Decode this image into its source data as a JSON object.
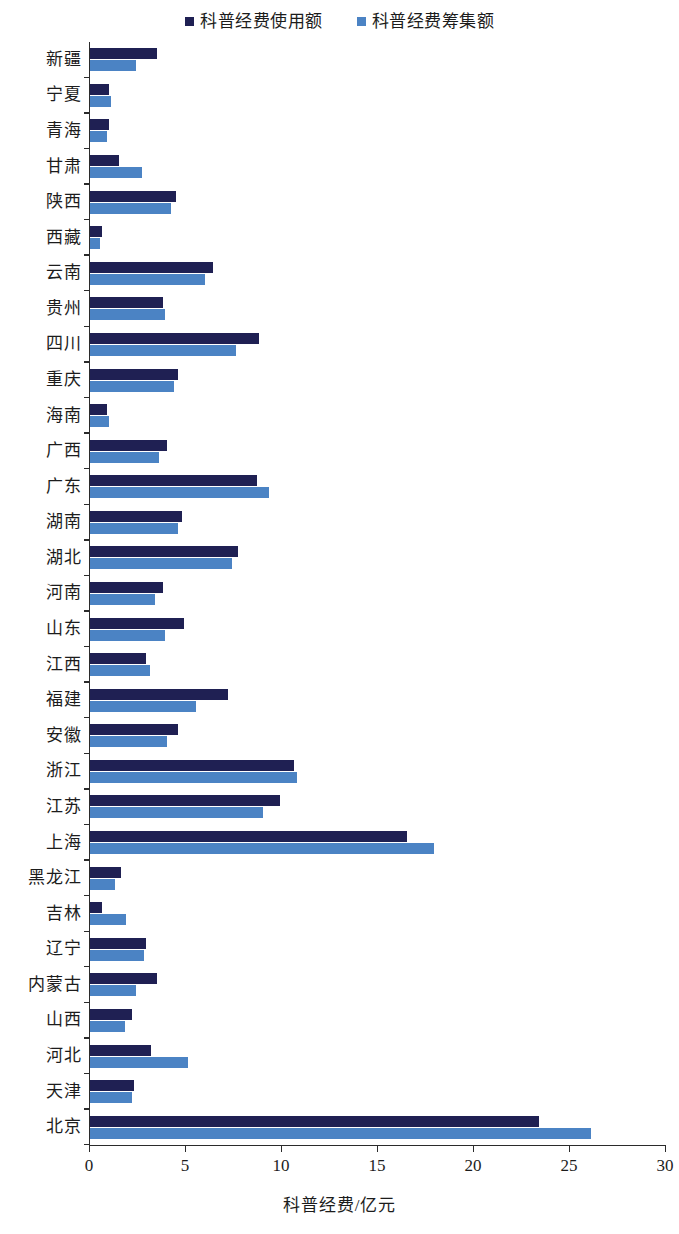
{
  "legend": {
    "items": [
      {
        "label": "科普经费使用额",
        "color": "#1f2053",
        "key": "used"
      },
      {
        "label": "科普经费筹集额",
        "color": "#4b83c4",
        "key": "raised"
      }
    ]
  },
  "axis": {
    "x_title": "科普经费/亿元",
    "x_ticks": [
      "0",
      "5",
      "10",
      "15",
      "20",
      "25",
      "30"
    ]
  },
  "chart_data": {
    "type": "bar",
    "orientation": "horizontal",
    "title": "",
    "xlabel": "科普经费/亿元",
    "ylabel": "",
    "xlim": [
      0,
      30
    ],
    "xticks": [
      0,
      5,
      10,
      15,
      20,
      25,
      30
    ],
    "grid": false,
    "legend_position": "top-center",
    "categories": [
      "新疆",
      "宁夏",
      "青海",
      "甘肃",
      "陕西",
      "西藏",
      "云南",
      "贵州",
      "四川",
      "重庆",
      "海南",
      "广西",
      "广东",
      "湖南",
      "湖北",
      "河南",
      "山东",
      "江西",
      "福建",
      "安徽",
      "浙江",
      "江苏",
      "上海",
      "黑龙江",
      "吉林",
      "辽宁",
      "内蒙古",
      "山西",
      "河北",
      "天津",
      "北京"
    ],
    "series": [
      {
        "name": "科普经费使用额",
        "color": "#1f2053",
        "values": [
          3.5,
          1.0,
          1.0,
          1.5,
          4.5,
          0.65,
          6.4,
          3.8,
          8.8,
          4.6,
          0.9,
          4.0,
          8.7,
          4.8,
          7.7,
          3.8,
          4.9,
          2.9,
          7.2,
          4.6,
          10.6,
          9.9,
          16.5,
          1.6,
          0.6,
          2.9,
          3.5,
          2.2,
          3.2,
          2.3,
          23.4
        ]
      },
      {
        "name": "科普经费筹集额",
        "color": "#4b83c4",
        "values": [
          2.4,
          1.1,
          0.9,
          2.7,
          4.2,
          0.5,
          6.0,
          3.9,
          7.6,
          4.4,
          1.0,
          3.6,
          9.3,
          4.6,
          7.4,
          3.4,
          3.9,
          3.1,
          5.5,
          4.0,
          10.8,
          9.0,
          17.9,
          1.3,
          1.9,
          2.8,
          2.4,
          1.8,
          5.1,
          2.2,
          26.1
        ]
      }
    ]
  }
}
